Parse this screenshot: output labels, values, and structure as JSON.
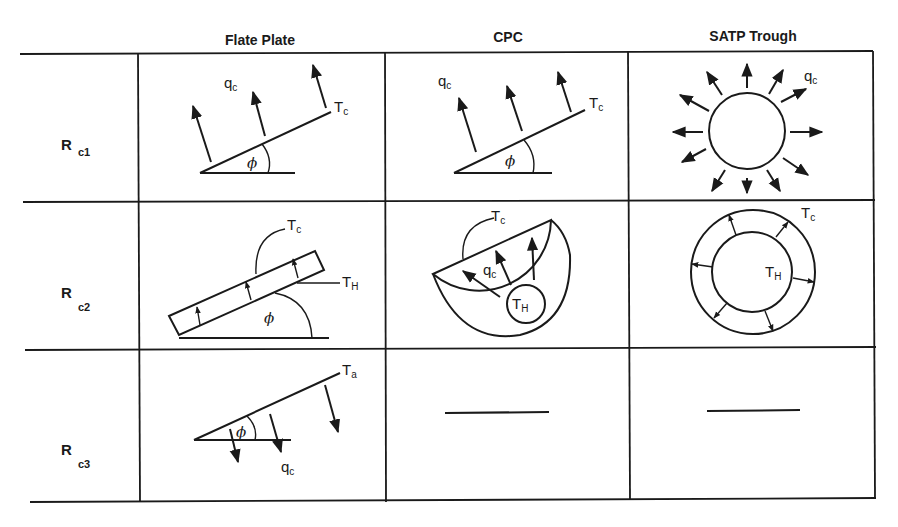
{
  "columns": [
    {
      "key": "flat_plate",
      "label": "Flate Plate"
    },
    {
      "key": "cpc",
      "label": "CPC"
    },
    {
      "key": "satp",
      "label": "SATP Trough"
    }
  ],
  "rows": [
    {
      "symbol": "R",
      "subscript": "c1"
    },
    {
      "symbol": "R",
      "subscript": "c2"
    },
    {
      "symbol": "R",
      "subscript": "c3"
    }
  ],
  "symbols": {
    "q": "q",
    "q_sub": "c",
    "T": "T",
    "Tc_sub": "c",
    "TH_sub": "H",
    "Ta_sub": "a",
    "phi": "ϕ"
  },
  "cells": {
    "r1_flat": {
      "labels": [
        "qc",
        "Tc",
        "phi"
      ],
      "arrows": 3
    },
    "r1_cpc": {
      "labels": [
        "qc",
        "Tc",
        "phi"
      ],
      "arrows": 3
    },
    "r1_satp": {
      "labels": [
        "qc"
      ],
      "arrows": 12
    },
    "r2_flat": {
      "labels": [
        "Tc",
        "TH",
        "phi"
      ],
      "arrows": 3
    },
    "r2_cpc": {
      "labels": [
        "Tc",
        "qc",
        "TH"
      ],
      "arrows": 3
    },
    "r2_satp": {
      "labels": [
        "Tc",
        "TH"
      ],
      "arrows": 6
    },
    "r3_flat": {
      "labels": [
        "Ta",
        "phi",
        "qc"
      ],
      "arrows": 3
    },
    "r3_cpc": {
      "value": "—"
    },
    "r3_satp": {
      "value": "—"
    }
  }
}
